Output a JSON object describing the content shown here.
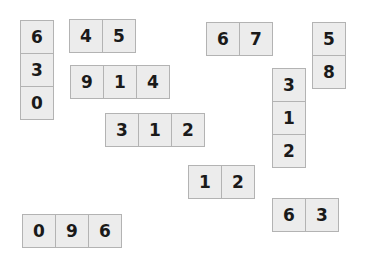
{
  "canvas": {
    "width": 368,
    "height": 272,
    "background_color": "#ffffff"
  },
  "style": {
    "tile_fill": "#ececec",
    "tile_border": "#b3b3b3",
    "digit_color": "#1a1a1a",
    "tile_size": 34
  },
  "groups": [
    {
      "id": "group-1",
      "orientation": "vertical",
      "x": 20,
      "y": 20,
      "digits": [
        "6",
        "3",
        "0"
      ]
    },
    {
      "id": "group-2",
      "orientation": "horizontal",
      "x": 69,
      "y": 19,
      "digits": [
        "4",
        "5"
      ]
    },
    {
      "id": "group-3",
      "orientation": "horizontal",
      "x": 70,
      "y": 65,
      "digits": [
        "9",
        "1",
        "4"
      ]
    },
    {
      "id": "group-4",
      "orientation": "horizontal",
      "x": 105,
      "y": 113,
      "digits": [
        "3",
        "1",
        "2"
      ]
    },
    {
      "id": "group-5",
      "orientation": "horizontal",
      "x": 188,
      "y": 165,
      "digits": [
        "1",
        "2"
      ]
    },
    {
      "id": "group-6",
      "orientation": "horizontal",
      "x": 22,
      "y": 214,
      "digits": [
        "0",
        "9",
        "6"
      ]
    },
    {
      "id": "group-7",
      "orientation": "horizontal",
      "x": 206,
      "y": 22,
      "digits": [
        "6",
        "7"
      ]
    },
    {
      "id": "group-8",
      "orientation": "vertical",
      "x": 312,
      "y": 22,
      "digits": [
        "5",
        "8"
      ]
    },
    {
      "id": "group-9",
      "orientation": "vertical",
      "x": 272,
      "y": 68,
      "digits": [
        "3",
        "1",
        "2"
      ]
    },
    {
      "id": "group-10",
      "orientation": "horizontal",
      "x": 272,
      "y": 198,
      "digits": [
        "6",
        "3"
      ]
    }
  ]
}
